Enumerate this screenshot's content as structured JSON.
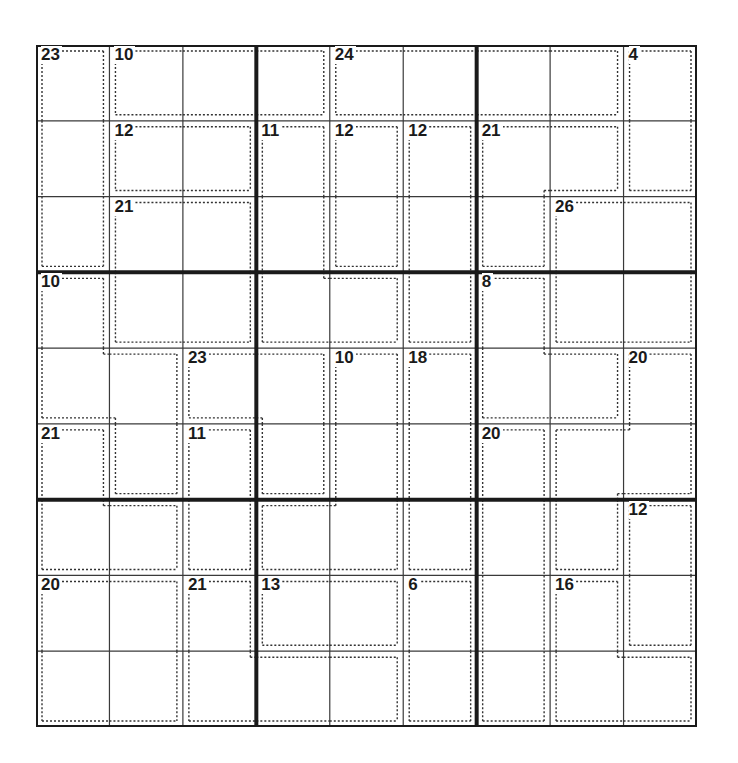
{
  "puzzle": {
    "type": "killer-sudoku",
    "size": 9,
    "box": 3,
    "colors": {
      "thin_line": "#3a3a3a",
      "thick_line": "#1a1a1a",
      "cage_line": "#333333",
      "background": "#ffffff"
    },
    "cages": [
      {
        "id": "A",
        "sum": 23,
        "cells": [
          [
            0,
            0
          ],
          [
            1,
            0
          ],
          [
            2,
            0
          ]
        ]
      },
      {
        "id": "B",
        "sum": 10,
        "cells": [
          [
            0,
            1
          ],
          [
            0,
            2
          ],
          [
            0,
            3
          ]
        ]
      },
      {
        "id": "C",
        "sum": 24,
        "cells": [
          [
            0,
            4
          ],
          [
            0,
            5
          ],
          [
            0,
            6
          ],
          [
            0,
            7
          ]
        ]
      },
      {
        "id": "D",
        "sum": 4,
        "cells": [
          [
            0,
            8
          ],
          [
            1,
            8
          ]
        ]
      },
      {
        "id": "E",
        "sum": 12,
        "cells": [
          [
            1,
            1
          ],
          [
            1,
            2
          ]
        ]
      },
      {
        "id": "F",
        "sum": 11,
        "cells": [
          [
            1,
            3
          ],
          [
            2,
            3
          ],
          [
            3,
            3
          ],
          [
            3,
            4
          ]
        ]
      },
      {
        "id": "G",
        "sum": 12,
        "cells": [
          [
            1,
            4
          ],
          [
            2,
            4
          ]
        ]
      },
      {
        "id": "H",
        "sum": 12,
        "cells": [
          [
            1,
            5
          ],
          [
            2,
            5
          ],
          [
            3,
            5
          ]
        ]
      },
      {
        "id": "I",
        "sum": 21,
        "cells": [
          [
            1,
            6
          ],
          [
            1,
            7
          ],
          [
            2,
            6
          ]
        ]
      },
      {
        "id": "J",
        "sum": 21,
        "cells": [
          [
            2,
            1
          ],
          [
            2,
            2
          ],
          [
            3,
            1
          ],
          [
            3,
            2
          ]
        ]
      },
      {
        "id": "K",
        "sum": 26,
        "cells": [
          [
            2,
            7
          ],
          [
            2,
            8
          ],
          [
            3,
            7
          ],
          [
            3,
            8
          ]
        ]
      },
      {
        "id": "L",
        "sum": 10,
        "cells": [
          [
            3,
            0
          ],
          [
            4,
            0
          ],
          [
            4,
            1
          ],
          [
            5,
            1
          ]
        ]
      },
      {
        "id": "M",
        "sum": 8,
        "cells": [
          [
            3,
            6
          ],
          [
            4,
            6
          ],
          [
            4,
            7
          ]
        ]
      },
      {
        "id": "N",
        "sum": 23,
        "cells": [
          [
            4,
            2
          ],
          [
            4,
            3
          ],
          [
            5,
            3
          ]
        ]
      },
      {
        "id": "O",
        "sum": 10,
        "cells": [
          [
            4,
            4
          ],
          [
            5,
            4
          ],
          [
            6,
            4
          ],
          [
            6,
            3
          ]
        ]
      },
      {
        "id": "P",
        "sum": 18,
        "cells": [
          [
            4,
            5
          ],
          [
            5,
            5
          ],
          [
            6,
            5
          ]
        ]
      },
      {
        "id": "Q",
        "sum": 20,
        "cells": [
          [
            4,
            8
          ],
          [
            5,
            7
          ],
          [
            5,
            8
          ],
          [
            6,
            7
          ]
        ]
      },
      {
        "id": "R",
        "sum": 21,
        "cells": [
          [
            5,
            0
          ],
          [
            6,
            0
          ],
          [
            6,
            1
          ]
        ]
      },
      {
        "id": "S",
        "sum": 11,
        "cells": [
          [
            5,
            2
          ],
          [
            6,
            2
          ]
        ]
      },
      {
        "id": "T",
        "sum": 20,
        "cells": [
          [
            5,
            6
          ],
          [
            6,
            6
          ],
          [
            7,
            6
          ],
          [
            8,
            6
          ]
        ]
      },
      {
        "id": "U",
        "sum": 12,
        "cells": [
          [
            6,
            8
          ],
          [
            7,
            8
          ]
        ]
      },
      {
        "id": "V",
        "sum": 20,
        "cells": [
          [
            7,
            0
          ],
          [
            7,
            1
          ],
          [
            8,
            0
          ],
          [
            8,
            1
          ]
        ]
      },
      {
        "id": "W",
        "sum": 21,
        "cells": [
          [
            7,
            2
          ],
          [
            8,
            2
          ],
          [
            8,
            3
          ],
          [
            8,
            4
          ]
        ]
      },
      {
        "id": "X",
        "sum": 13,
        "cells": [
          [
            7,
            3
          ],
          [
            7,
            4
          ]
        ]
      },
      {
        "id": "Y",
        "sum": 6,
        "cells": [
          [
            7,
            5
          ],
          [
            8,
            5
          ]
        ]
      },
      {
        "id": "Z",
        "sum": 16,
        "cells": [
          [
            7,
            7
          ],
          [
            8,
            7
          ],
          [
            8,
            8
          ]
        ]
      }
    ],
    "values": [
      [
        "",
        "",
        "",
        "",
        "",
        "",
        "",
        "",
        ""
      ],
      [
        "",
        "",
        "",
        "",
        "",
        "",
        "",
        "",
        ""
      ],
      [
        "",
        "",
        "",
        "",
        "",
        "",
        "",
        "",
        ""
      ],
      [
        "",
        "",
        "",
        "",
        "",
        "",
        "",
        "",
        ""
      ],
      [
        "",
        "",
        "",
        "",
        "",
        "",
        "",
        "",
        ""
      ],
      [
        "",
        "",
        "",
        "",
        "",
        "",
        "",
        "",
        ""
      ],
      [
        "",
        "",
        "",
        "",
        "",
        "",
        "",
        "",
        ""
      ],
      [
        "",
        "",
        "",
        "",
        "",
        "",
        "",
        "",
        ""
      ],
      [
        "",
        "",
        "",
        "",
        "",
        "",
        "",
        "",
        ""
      ]
    ]
  }
}
